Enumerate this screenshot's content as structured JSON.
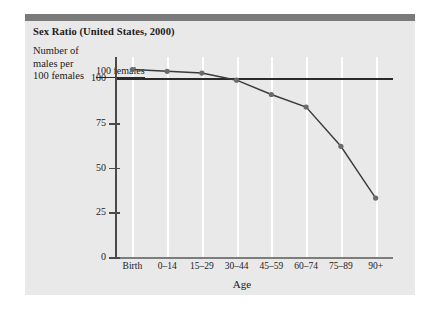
{
  "figure": {
    "background": "#ffffff",
    "panel_color": "#e9e9e9",
    "banner_color": "#7a7a7a",
    "line_color": "#3a3a3a",
    "marker_color": "#6b6b6b",
    "gridline_color": "#ffffff",
    "refline_color": "#2a2a2a"
  },
  "title": "Sex Ratio (United States, 2000)",
  "ylabel_lines": [
    "Number of",
    "males per",
    "100 females"
  ],
  "reference_annotation": "100 females",
  "axis_title_x": "Age",
  "chart_data": {
    "type": "line",
    "title": "Sex Ratio (United States, 2000)",
    "xlabel": "Age",
    "ylabel": "Number of males per 100 females",
    "categories": [
      "Birth",
      "0–14",
      "15–29",
      "30–44",
      "45–59",
      "60–74",
      "75–89",
      "90+"
    ],
    "values": [
      105,
      104,
      103,
      99,
      91,
      84,
      62,
      33
    ],
    "yticks": [
      0,
      25,
      50,
      75,
      100
    ],
    "ytick_labels": [
      "0",
      "25",
      "50",
      "75",
      "100"
    ],
    "ylim": [
      0,
      112
    ],
    "grid": "vertical-only",
    "legend": "none",
    "annotations": [
      {
        "text": "100 females",
        "type": "reference-line",
        "y": 100
      }
    ],
    "marker": "circle",
    "series": [
      {
        "name": "Sex ratio",
        "values": [
          105,
          104,
          103,
          99,
          91,
          84,
          62,
          33
        ]
      }
    ]
  }
}
